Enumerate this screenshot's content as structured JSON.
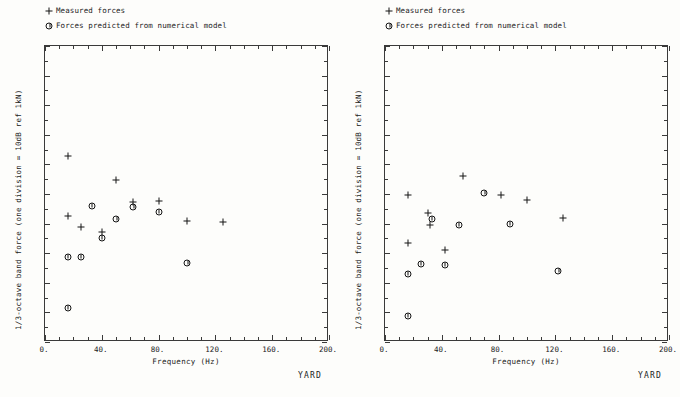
{
  "figure": {
    "caption": "YARD",
    "legend": [
      {
        "marker": "plus-icon",
        "label": "Measured forces"
      },
      {
        "marker": "circle-tick-icon",
        "label": "Forces predicted from numerical model"
      }
    ]
  },
  "chart_data": [
    {
      "id": "left-panel",
      "type": "scatter",
      "title": "",
      "xlabel": "Frequency  (Hz)",
      "ylabel": "1/3-octave band force (one division = 10dB ref 1kN)",
      "xlim": [
        0,
        200
      ],
      "ylim": [
        0,
        100
      ],
      "xticks": [
        0,
        40,
        80,
        120,
        160,
        200
      ],
      "xticklabels": [
        "0.",
        "40.",
        "80.",
        "120.",
        "160.",
        "200."
      ],
      "yticklabels": [],
      "xminor_step": 10,
      "yticks_major": [
        0,
        10,
        20,
        30,
        40,
        50,
        60,
        70,
        80,
        90,
        100
      ],
      "grid": false,
      "legend_position": "above-left",
      "series": [
        {
          "name": "Measured forces",
          "marker": "plus-icon",
          "points": [
            {
              "x": 16,
              "y": 62.8
            },
            {
              "x": 16,
              "y": 42.5
            },
            {
              "x": 25,
              "y": 38.7
            },
            {
              "x": 40,
              "y": 37.1
            },
            {
              "x": 50,
              "y": 54.6
            },
            {
              "x": 62,
              "y": 47.2
            },
            {
              "x": 80,
              "y": 47.8
            },
            {
              "x": 100,
              "y": 41.0
            },
            {
              "x": 125,
              "y": 40.6
            }
          ]
        },
        {
          "name": "Forces predicted from numerical model",
          "marker": "circle-tick-icon",
          "points": [
            {
              "x": 16,
              "y": 28.8
            },
            {
              "x": 16,
              "y": 11.5
            },
            {
              "x": 25,
              "y": 28.6
            },
            {
              "x": 33,
              "y": 45.8
            },
            {
              "x": 40,
              "y": 35.0
            },
            {
              "x": 50,
              "y": 41.4
            },
            {
              "x": 62,
              "y": 45.5
            },
            {
              "x": 80,
              "y": 43.8
            },
            {
              "x": 100,
              "y": 26.7
            }
          ]
        }
      ]
    },
    {
      "id": "right-panel",
      "type": "scatter",
      "title": "",
      "xlabel": "Frequency  (Hz)",
      "ylabel": "1/3-octave band force (one division = 10dB ref 1kN)",
      "xlim": [
        0,
        200
      ],
      "ylim": [
        0,
        100
      ],
      "xticks": [
        0,
        40,
        80,
        120,
        160,
        200
      ],
      "xticklabels": [
        "0.",
        "40.",
        "80.",
        "120.",
        "160.",
        "200."
      ],
      "yticklabels": [],
      "xminor_step": 10,
      "yticks_major": [
        0,
        10,
        20,
        30,
        40,
        50,
        60,
        70,
        80,
        90,
        100
      ],
      "grid": false,
      "legend_position": "above-left",
      "series": [
        {
          "name": "Measured forces",
          "marker": "plus-icon",
          "points": [
            {
              "x": 16,
              "y": 49.8
            },
            {
              "x": 16,
              "y": 33.3
            },
            {
              "x": 30,
              "y": 43.7
            },
            {
              "x": 32,
              "y": 39.4
            },
            {
              "x": 42,
              "y": 31.0
            },
            {
              "x": 55,
              "y": 56.0
            },
            {
              "x": 82,
              "y": 49.7
            },
            {
              "x": 100,
              "y": 48.0
            },
            {
              "x": 125,
              "y": 42.0
            }
          ]
        },
        {
          "name": "Forces predicted from numerical model",
          "marker": "circle-tick-icon",
          "points": [
            {
              "x": 16,
              "y": 23.0
            },
            {
              "x": 16,
              "y": 8.8
            },
            {
              "x": 25,
              "y": 26.5
            },
            {
              "x": 33,
              "y": 41.5
            },
            {
              "x": 42,
              "y": 26.0
            },
            {
              "x": 52,
              "y": 39.5
            },
            {
              "x": 70,
              "y": 50.2
            },
            {
              "x": 88,
              "y": 40.0
            },
            {
              "x": 122,
              "y": 24.0
            }
          ]
        }
      ]
    }
  ]
}
